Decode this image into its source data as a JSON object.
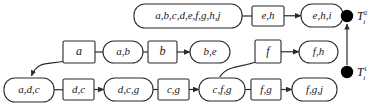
{
  "diagram": {
    "colors": {
      "background": "#ffffff",
      "stroke": "#2b2b2b",
      "text": "#1a1a1a",
      "marker_fill": "#000000"
    },
    "nodes": [
      {
        "id": "n_top_1",
        "label": "a,b,c,d,e,f,g,h,j",
        "shape": "rounded",
        "x": 134,
        "y": 4,
        "w": 108,
        "h": 24,
        "font": 11
      },
      {
        "id": "n_top_2",
        "label": "e,h",
        "shape": "rect",
        "x": 252,
        "y": 6,
        "w": 32,
        "h": 20,
        "font": 11
      },
      {
        "id": "n_top_3",
        "label": "e,h,i",
        "shape": "rounded",
        "x": 301,
        "y": 4,
        "w": 42,
        "h": 23,
        "font": 11
      },
      {
        "id": "n_mid_1",
        "label": "a",
        "shape": "rect",
        "x": 63,
        "y": 41,
        "w": 32,
        "h": 22,
        "font": 12
      },
      {
        "id": "n_mid_2",
        "label": "a,b",
        "shape": "rounded",
        "x": 103,
        "y": 41,
        "w": 40,
        "h": 22,
        "font": 11
      },
      {
        "id": "n_mid_3",
        "label": "b",
        "shape": "rect",
        "x": 148,
        "y": 41,
        "w": 29,
        "h": 22,
        "font": 12
      },
      {
        "id": "n_mid_4",
        "label": "b,e",
        "shape": "rounded",
        "x": 190,
        "y": 41,
        "w": 40,
        "h": 22,
        "font": 11
      },
      {
        "id": "n_mid_5",
        "label": "f",
        "shape": "rect",
        "x": 255,
        "y": 40,
        "w": 26,
        "h": 23,
        "font": 12
      },
      {
        "id": "n_mid_6",
        "label": "f,h",
        "shape": "rounded",
        "x": 299,
        "y": 41,
        "w": 39,
        "h": 22,
        "font": 11
      },
      {
        "id": "n_bot_1",
        "label": "a,d,c",
        "shape": "rounded",
        "x": 4,
        "y": 78,
        "w": 50,
        "h": 24,
        "font": 11
      },
      {
        "id": "n_bot_2",
        "label": "d,c",
        "shape": "rect",
        "x": 63,
        "y": 79,
        "w": 31,
        "h": 21,
        "font": 11
      },
      {
        "id": "n_bot_3",
        "label": "d,c,g",
        "shape": "rounded",
        "x": 104,
        "y": 78,
        "w": 49,
        "h": 23,
        "font": 11
      },
      {
        "id": "n_bot_4",
        "label": "c,g",
        "shape": "rect",
        "x": 158,
        "y": 79,
        "w": 31,
        "h": 21,
        "font": 11
      },
      {
        "id": "n_bot_5",
        "label": "c,f,g",
        "shape": "rounded",
        "x": 199,
        "y": 78,
        "w": 46,
        "h": 23,
        "font": 11
      },
      {
        "id": "n_bot_6",
        "label": "f,g",
        "shape": "rect",
        "x": 251,
        "y": 79,
        "w": 30,
        "h": 21,
        "font": 11
      },
      {
        "id": "n_bot_7",
        "label": "f,g,j",
        "shape": "rounded",
        "x": 292,
        "y": 78,
        "w": 45,
        "h": 23,
        "font": 11
      }
    ],
    "edges": [
      {
        "id": "e_top_1",
        "from": "n_top_1",
        "to": "n_top_2",
        "type": "plain"
      },
      {
        "id": "e_top_2",
        "from": "n_top_2",
        "to": "n_top_3",
        "type": "arrow"
      },
      {
        "id": "e_mid_1",
        "from": "n_mid_1",
        "to": "n_mid_2",
        "type": "plain"
      },
      {
        "id": "e_mid_2",
        "from": "n_mid_2",
        "to": "n_mid_3",
        "type": "plain"
      },
      {
        "id": "e_mid_3",
        "from": "n_mid_3",
        "to": "n_mid_4",
        "type": "arrow"
      },
      {
        "id": "e_mid_4",
        "from": "n_mid_5",
        "to": "n_mid_6",
        "type": "arrow"
      },
      {
        "id": "e_bot_1",
        "from": "n_bot_1",
        "to": "n_bot_2",
        "type": "plain"
      },
      {
        "id": "e_bot_2",
        "from": "n_bot_2",
        "to": "n_bot_3",
        "type": "arrow"
      },
      {
        "id": "e_bot_3",
        "from": "n_bot_3",
        "to": "n_bot_4",
        "type": "plain"
      },
      {
        "id": "e_bot_4",
        "from": "n_bot_4",
        "to": "n_bot_5",
        "type": "arrow"
      },
      {
        "id": "e_bot_5",
        "from": "n_bot_5",
        "to": "n_bot_6",
        "type": "plain"
      },
      {
        "id": "e_bot_6",
        "from": "n_bot_6",
        "to": "n_bot_7",
        "type": "arrow"
      },
      {
        "id": "e_curve_1",
        "from": "n_mid_1",
        "to": "n_bot_1",
        "type": "curved-arrow"
      },
      {
        "id": "e_curve_2",
        "from": "n_bot_5",
        "to": "n_mid_5",
        "type": "curved-plain"
      }
    ],
    "time_axis": {
      "upper": {
        "symbol": "T",
        "superscript": "2",
        "subscript": "i",
        "cx": 347,
        "cy": 16
      },
      "lower": {
        "symbol": "T",
        "superscript": "1",
        "subscript": "i",
        "cx": 347,
        "cy": 72
      },
      "arrow_direction": "up"
    }
  }
}
